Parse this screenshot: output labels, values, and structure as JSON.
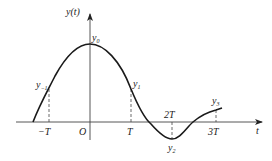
{
  "figure": {
    "type": "function-plot",
    "y_axis_label": "y(t)",
    "x_axis_label": "t",
    "origin_label": "O",
    "x_ticks": [
      {
        "label": "−T",
        "value": "-T"
      },
      {
        "label": "T",
        "value": "T"
      },
      {
        "label": "2T",
        "value": "2T"
      },
      {
        "label": "3T",
        "value": "3T"
      }
    ],
    "sample_points": [
      {
        "name": "y-1",
        "base": "y",
        "sub": "−1",
        "t": "-T"
      },
      {
        "name": "y0",
        "base": "y",
        "sub": "0",
        "t": "0"
      },
      {
        "name": "y1",
        "base": "y",
        "sub": "1",
        "t": "T"
      },
      {
        "name": "y2",
        "base": "y",
        "sub": "2",
        "t": "2T"
      },
      {
        "name": "y3",
        "base": "y",
        "sub": "3",
        "t": "3T"
      }
    ],
    "colors": {
      "curve": "#1a1a1a",
      "axis": "#444444",
      "background": "#ffffff"
    }
  }
}
